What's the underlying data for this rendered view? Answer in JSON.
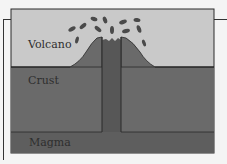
{
  "diagram": {
    "labels": {
      "volcano": "Volcano",
      "crust": "Crust",
      "magma": "Magma"
    },
    "colors": {
      "sky": "#c9c9c9",
      "crust": "#6a6a6a",
      "magma": "#5e5e5e",
      "vent": "#575757",
      "outline": "#2a2a2a",
      "background": "#f4f4f4"
    }
  }
}
